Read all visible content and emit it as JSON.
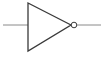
{
  "diagram": {
    "type": "logic-gate",
    "gate": "NOT",
    "title": "NOT gate (inverter)",
    "input_label": "",
    "output_label": "",
    "colors": {
      "stroke": "#3a3a3a",
      "wire": "#8a8a8a",
      "background": "#ffffff"
    }
  }
}
